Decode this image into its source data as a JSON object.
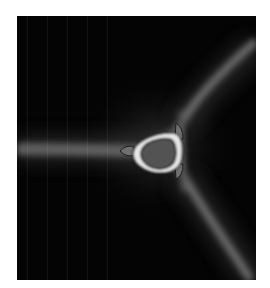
{
  "image": {
    "description": "Grayscale field: dark background with three diffuse grey arms meeting at a triangular bright ring structure",
    "background_color": "#040404",
    "arm_color": "#6a6a6a",
    "ring_color": "#e8e8e8",
    "core_color": "#555555",
    "page_background": "#ffffff"
  }
}
